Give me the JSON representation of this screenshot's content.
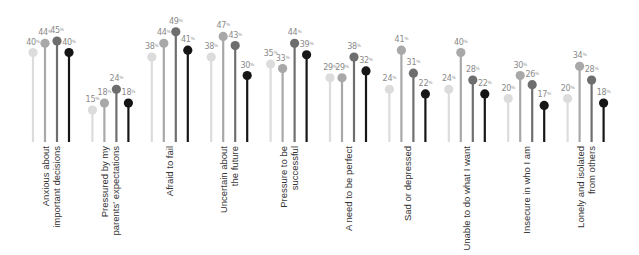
{
  "chart_data": {
    "type": "lollipop",
    "title": "",
    "xlabel": "",
    "ylabel": "",
    "ylim": [
      0,
      55
    ],
    "grid": false,
    "legend": null,
    "value_suffix": "%",
    "categories": [
      [
        "Anxious about",
        "important decisions"
      ],
      [
        "Pressured by my",
        "parents' expectations"
      ],
      [
        "Afraid to fail"
      ],
      [
        "Uncertain about",
        "the future"
      ],
      [
        "Pressure to be",
        "successful"
      ],
      [
        "A need to be perfect"
      ],
      [
        "Sad or depressed"
      ],
      [
        "Unable to do what I want"
      ],
      [
        "Insecure in who I am"
      ],
      [
        "Lonely and isolated",
        "from others"
      ]
    ],
    "series": [
      {
        "name": "Series 1",
        "color": "#dcdcdc",
        "values": [
          40,
          15,
          38,
          38,
          35,
          29,
          24,
          24,
          20,
          20
        ]
      },
      {
        "name": "Series 2",
        "color": "#a8a8a8",
        "values": [
          44,
          18,
          44,
          47,
          33,
          29,
          41,
          40,
          30,
          34
        ]
      },
      {
        "name": "Series 3",
        "color": "#6e6e6e",
        "values": [
          45,
          24,
          49,
          43,
          44,
          38,
          31,
          28,
          26,
          28
        ]
      },
      {
        "name": "Series 4",
        "color": "#161616",
        "values": [
          40,
          18,
          41,
          30,
          39,
          32,
          22,
          22,
          17,
          18
        ]
      }
    ]
  },
  "layout": {
    "group_start_x": 33,
    "group_spacing": 59.4,
    "stem_spacing": 12,
    "baseline_y": 144.5,
    "px_per_unit": 2.3,
    "stem_bottom_y": 142,
    "label_top_y": 146
  }
}
